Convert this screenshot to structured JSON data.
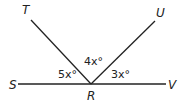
{
  "points": {
    "T": "T",
    "U": "U",
    "S": "S",
    "V": "V",
    "R": "R"
  },
  "angles": {
    "SRT": "5x°",
    "TRU": "4x°",
    "URV": "3x°"
  },
  "colors": {
    "line": "#222222",
    "background": "#ffffff"
  }
}
